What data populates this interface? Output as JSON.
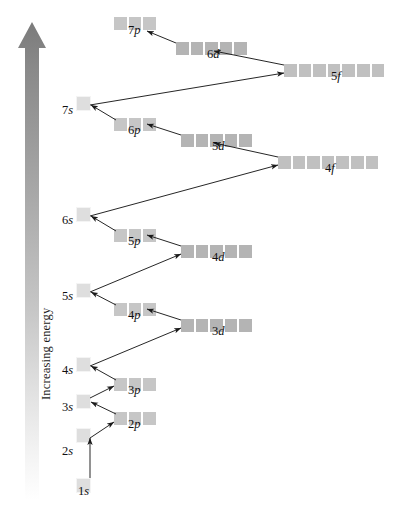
{
  "figure": {
    "type": "aufbau-orbital-energy-diagram",
    "axis_label": "Increasing energy",
    "axis_direction": "up",
    "background": "#ffffff",
    "colors": {
      "s_orbital": "#dedede",
      "p_orbital": "#c6c6c6",
      "d_orbital": "#b4b4b4",
      "f_orbital": "#c0c0c0",
      "arrow_line": "#1a1a1a",
      "energy_arrow_top": "#7d7d7d",
      "energy_arrow_bottom": "#ffffff"
    }
  },
  "orbitals": [
    {
      "id": "1s",
      "n": "1",
      "l": "s",
      "boxes": 1,
      "x": 76,
      "y": 478,
      "label_x": 78,
      "label_y": 497,
      "label_anchor": "left"
    },
    {
      "id": "2s",
      "n": "2",
      "l": "s",
      "boxes": 1,
      "x": 76,
      "y": 428,
      "label_x": 62,
      "label_y": 457,
      "label_anchor": "left"
    },
    {
      "id": "2p",
      "n": "2",
      "l": "p",
      "boxes": 3,
      "x": 113,
      "y": 411,
      "label_x": 128,
      "label_y": 430,
      "label_anchor": "left"
    },
    {
      "id": "3s",
      "n": "3",
      "l": "s",
      "boxes": 1,
      "x": 76,
      "y": 394,
      "label_x": 62,
      "label_y": 413,
      "label_anchor": "left"
    },
    {
      "id": "3p",
      "n": "3",
      "l": "p",
      "boxes": 3,
      "x": 113,
      "y": 377,
      "label_x": 128,
      "label_y": 396,
      "label_anchor": "left"
    },
    {
      "id": "4s",
      "n": "4",
      "l": "s",
      "boxes": 1,
      "x": 76,
      "y": 357,
      "label_x": 62,
      "label_y": 376,
      "label_anchor": "left"
    },
    {
      "id": "3d",
      "n": "3",
      "l": "d",
      "boxes": 5,
      "x": 180,
      "y": 318,
      "label_x": 212,
      "label_y": 337,
      "label_anchor": "left"
    },
    {
      "id": "4p",
      "n": "4",
      "l": "p",
      "boxes": 3,
      "x": 113,
      "y": 302,
      "label_x": 128,
      "label_y": 321,
      "label_anchor": "left"
    },
    {
      "id": "5s",
      "n": "5",
      "l": "s",
      "boxes": 1,
      "x": 76,
      "y": 283,
      "label_x": 62,
      "label_y": 302,
      "label_anchor": "left"
    },
    {
      "id": "4d",
      "n": "4",
      "l": "d",
      "boxes": 5,
      "x": 180,
      "y": 244,
      "label_x": 212,
      "label_y": 263,
      "label_anchor": "left"
    },
    {
      "id": "5p",
      "n": "5",
      "l": "p",
      "boxes": 3,
      "x": 113,
      "y": 228,
      "label_x": 128,
      "label_y": 247,
      "label_anchor": "left"
    },
    {
      "id": "6s",
      "n": "6",
      "l": "s",
      "boxes": 1,
      "x": 76,
      "y": 207,
      "label_x": 62,
      "label_y": 226,
      "label_anchor": "left"
    },
    {
      "id": "4f",
      "n": "4",
      "l": "f",
      "boxes": 7,
      "x": 277,
      "y": 155,
      "label_x": 325,
      "label_y": 174,
      "label_anchor": "left"
    },
    {
      "id": "5d",
      "n": "5",
      "l": "d",
      "boxes": 5,
      "x": 180,
      "y": 133,
      "label_x": 212,
      "label_y": 152,
      "label_anchor": "left"
    },
    {
      "id": "6p",
      "n": "6",
      "l": "p",
      "boxes": 3,
      "x": 113,
      "y": 117,
      "label_x": 128,
      "label_y": 136,
      "label_anchor": "left"
    },
    {
      "id": "7s",
      "n": "7",
      "l": "s",
      "boxes": 1,
      "x": 76,
      "y": 96,
      "label_x": 62,
      "label_y": 116,
      "label_anchor": "left"
    },
    {
      "id": "5f",
      "n": "5",
      "l": "f",
      "boxes": 7,
      "x": 283,
      "y": 63,
      "label_x": 331,
      "label_y": 82,
      "label_anchor": "left"
    },
    {
      "id": "6d",
      "n": "6",
      "l": "d",
      "boxes": 5,
      "x": 175,
      "y": 41,
      "label_x": 207,
      "label_y": 60,
      "label_anchor": "left"
    },
    {
      "id": "7p",
      "n": "7",
      "l": "p",
      "boxes": 3,
      "x": 113,
      "y": 16,
      "label_x": 128,
      "label_y": 36,
      "label_anchor": "left"
    }
  ],
  "filling_arrows": [
    {
      "from": "1s",
      "to": "2s",
      "x1": 90,
      "y1": 478,
      "x2": 90,
      "y2": 438
    },
    {
      "from": "2s",
      "to": "2p",
      "x1": 90,
      "y1": 438,
      "x2": 114,
      "y2": 422
    },
    {
      "from": "2p",
      "to": "3s",
      "x1": 116,
      "y1": 414,
      "x2": 91,
      "y2": 402
    },
    {
      "from": "3s",
      "to": "3p",
      "x1": 90,
      "y1": 398,
      "x2": 114,
      "y2": 386
    },
    {
      "from": "3p",
      "to": "4s",
      "x1": 116,
      "y1": 380,
      "x2": 91,
      "y2": 366
    },
    {
      "from": "4s",
      "to": "3d",
      "x1": 90,
      "y1": 366,
      "x2": 181,
      "y2": 328
    },
    {
      "from": "3d",
      "to": "4p",
      "x1": 181,
      "y1": 320,
      "x2": 147,
      "y2": 309
    },
    {
      "from": "4p",
      "to": "5s",
      "x1": 116,
      "y1": 305,
      "x2": 91,
      "y2": 292
    },
    {
      "from": "5s",
      "to": "4d",
      "x1": 90,
      "y1": 292,
      "x2": 181,
      "y2": 254
    },
    {
      "from": "4d",
      "to": "5p",
      "x1": 181,
      "y1": 246,
      "x2": 147,
      "y2": 235
    },
    {
      "from": "5p",
      "to": "6s",
      "x1": 116,
      "y1": 231,
      "x2": 91,
      "y2": 216
    },
    {
      "from": "6s",
      "to": "4f",
      "x1": 90,
      "y1": 216,
      "x2": 278,
      "y2": 165
    },
    {
      "from": "4f",
      "to": "5d",
      "x1": 278,
      "y1": 157,
      "x2": 214,
      "y2": 143
    },
    {
      "from": "5d",
      "to": "6p",
      "x1": 181,
      "y1": 135,
      "x2": 147,
      "y2": 124
    },
    {
      "from": "6p",
      "to": "7s",
      "x1": 116,
      "y1": 120,
      "x2": 91,
      "y2": 105
    },
    {
      "from": "7s",
      "to": "5f",
      "x1": 90,
      "y1": 105,
      "x2": 284,
      "y2": 73
    },
    {
      "from": "5f",
      "to": "6d",
      "x1": 284,
      "y1": 65,
      "x2": 214,
      "y2": 51
    },
    {
      "from": "6d",
      "to": "7p",
      "x1": 176,
      "y1": 43,
      "x2": 147,
      "y2": 31
    }
  ]
}
